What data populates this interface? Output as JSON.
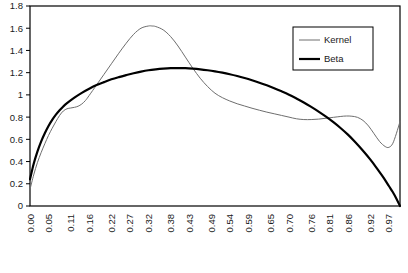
{
  "chart_data": {
    "type": "line",
    "title": "",
    "xlabel": "",
    "ylabel": "",
    "xlim": [
      0.0,
      1.0
    ],
    "ylim": [
      0.0,
      1.8
    ],
    "grid": false,
    "legend_position": "top-right",
    "y_ticks": [
      "1.8",
      "1.6",
      "1.4",
      "1.2",
      "1",
      "0.8",
      "0.6",
      "0.4",
      "0.2",
      "0"
    ],
    "y_tick_values": [
      1.8,
      1.6,
      1.4,
      1.2,
      1.0,
      0.8,
      0.6,
      0.4,
      0.2,
      0.0
    ],
    "x_ticks": [
      "0.00",
      "0.05",
      "0.11",
      "0.16",
      "0.22",
      "0.27",
      "0.32",
      "0.38",
      "0.43",
      "0.49",
      "0.54",
      "0.59",
      "0.65",
      "0.70",
      "0.76",
      "0.81",
      "0.86",
      "0.92",
      "0.97"
    ],
    "x_tick_values": [
      0.0,
      0.05,
      0.11,
      0.16,
      0.22,
      0.27,
      0.32,
      0.38,
      0.43,
      0.49,
      0.54,
      0.59,
      0.65,
      0.7,
      0.76,
      0.81,
      0.86,
      0.92,
      0.97
    ],
    "series": [
      {
        "name": "Kernel",
        "color": "#6e6e6e",
        "width": 1.0,
        "x": [
          0.0,
          0.01,
          0.02,
          0.03,
          0.04,
          0.05,
          0.06,
          0.07,
          0.08,
          0.09,
          0.1,
          0.11,
          0.12,
          0.13,
          0.14,
          0.15,
          0.16,
          0.18,
          0.2,
          0.22,
          0.24,
          0.26,
          0.28,
          0.3,
          0.32,
          0.33,
          0.34,
          0.36,
          0.38,
          0.4,
          0.42,
          0.44,
          0.46,
          0.48,
          0.5,
          0.52,
          0.54,
          0.56,
          0.58,
          0.6,
          0.62,
          0.64,
          0.66,
          0.68,
          0.7,
          0.72,
          0.74,
          0.76,
          0.78,
          0.8,
          0.82,
          0.84,
          0.855,
          0.87,
          0.885,
          0.9,
          0.915,
          0.93,
          0.945,
          0.96,
          0.97,
          0.98,
          0.99,
          1.0
        ],
        "y": [
          0.15,
          0.28,
          0.39,
          0.48,
          0.56,
          0.635,
          0.7,
          0.76,
          0.815,
          0.855,
          0.875,
          0.882,
          0.888,
          0.898,
          0.918,
          0.95,
          0.995,
          1.09,
          1.185,
          1.28,
          1.375,
          1.465,
          1.545,
          1.6,
          1.62,
          1.62,
          1.615,
          1.585,
          1.525,
          1.44,
          1.34,
          1.24,
          1.15,
          1.075,
          1.015,
          0.975,
          0.945,
          0.92,
          0.9,
          0.88,
          0.862,
          0.845,
          0.83,
          0.815,
          0.8,
          0.785,
          0.778,
          0.778,
          0.782,
          0.79,
          0.798,
          0.806,
          0.81,
          0.808,
          0.798,
          0.77,
          0.72,
          0.65,
          0.58,
          0.535,
          0.528,
          0.56,
          0.65,
          0.76
        ]
      },
      {
        "name": "Beta",
        "color": "#000000",
        "width": 2.2,
        "x": [
          0.0,
          0.01,
          0.02,
          0.03,
          0.04,
          0.05,
          0.06,
          0.07,
          0.08,
          0.09,
          0.1,
          0.12,
          0.14,
          0.16,
          0.18,
          0.2,
          0.22,
          0.24,
          0.26,
          0.28,
          0.3,
          0.32,
          0.34,
          0.36,
          0.38,
          0.4,
          0.42,
          0.44,
          0.46,
          0.48,
          0.5,
          0.52,
          0.54,
          0.56,
          0.58,
          0.6,
          0.62,
          0.64,
          0.66,
          0.68,
          0.7,
          0.72,
          0.74,
          0.76,
          0.78,
          0.8,
          0.82,
          0.84,
          0.86,
          0.88,
          0.9,
          0.92,
          0.94,
          0.955,
          0.97,
          0.98,
          0.99,
          1.0
        ],
        "y": [
          0.24,
          0.38,
          0.49,
          0.58,
          0.655,
          0.72,
          0.775,
          0.822,
          0.862,
          0.896,
          0.925,
          0.975,
          1.018,
          1.055,
          1.088,
          1.115,
          1.14,
          1.16,
          1.178,
          1.195,
          1.21,
          1.222,
          1.23,
          1.236,
          1.24,
          1.241,
          1.24,
          1.236,
          1.23,
          1.222,
          1.212,
          1.2,
          1.186,
          1.17,
          1.152,
          1.132,
          1.11,
          1.086,
          1.06,
          1.032,
          1.002,
          0.968,
          0.932,
          0.892,
          0.85,
          0.804,
          0.754,
          0.7,
          0.64,
          0.572,
          0.498,
          0.418,
          0.328,
          0.258,
          0.18,
          0.128,
          0.068,
          0.0
        ]
      }
    ]
  },
  "legend": {
    "items": [
      {
        "label": "Kernel"
      },
      {
        "label": "Beta"
      }
    ]
  },
  "axes": {
    "y_axis_color": "#000000",
    "x_axis_color": "#000000",
    "plot_border_color": "#000000"
  }
}
